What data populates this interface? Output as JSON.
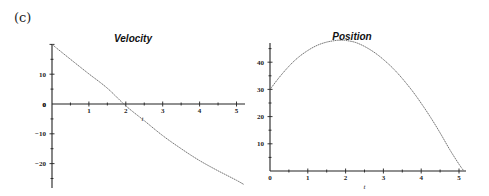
{
  "panel_label": "(c)",
  "chart_data": [
    {
      "type": "line",
      "title": "Velocity",
      "xlabel": "t",
      "ylabel": "",
      "xlim": [
        0,
        5.2
      ],
      "ylim": [
        -27,
        20
      ],
      "xticks": [
        1,
        2,
        3,
        4,
        5
      ],
      "yticks": [
        -20,
        -10,
        0,
        10
      ],
      "grid": false,
      "legend": null,
      "series": [
        {
          "name": "velocity",
          "x": [
            0,
            0.5,
            1.0,
            1.5,
            2.0,
            2.5,
            3.0,
            3.5,
            4.0,
            4.5,
            5.0,
            5.2
          ],
          "y": [
            20,
            15.0,
            10.1,
            5.3,
            -0.6,
            -5.6,
            -10.6,
            -15.0,
            -19.0,
            -22.4,
            -25.6,
            -27.0
          ]
        }
      ],
      "frame": {
        "ox": 52,
        "x_per_unit": 36.9,
        "oy": 104,
        "y_per_unit": 2.98,
        "axis_top": 44,
        "axis_bottom": 188,
        "axis_right": 245
      },
      "title_pos": {
        "x": 133,
        "y": 42
      }
    },
    {
      "type": "line",
      "title": "Position",
      "xlabel": "t",
      "ylabel": "",
      "xlim": [
        0,
        5.12
      ],
      "ylim": [
        0,
        48
      ],
      "xticks": [
        0,
        1,
        2,
        3,
        4,
        5
      ],
      "yticks": [
        10,
        20,
        30,
        40
      ],
      "grid": false,
      "legend": null,
      "series": [
        {
          "name": "position",
          "x": [
            0,
            0.25,
            0.5,
            0.75,
            1.0,
            1.25,
            1.5,
            1.75,
            1.9,
            2.0,
            2.25,
            2.5,
            2.75,
            3.0,
            3.25,
            3.5,
            3.75,
            4.0,
            4.25,
            4.5,
            4.75,
            5.0,
            5.12
          ],
          "y": [
            30,
            34.5,
            38.5,
            41.8,
            44.3,
            46.2,
            47.4,
            48.0,
            48.1,
            48.0,
            47.3,
            45.8,
            43.7,
            41.0,
            37.8,
            34.0,
            29.7,
            24.9,
            19.7,
            14.0,
            8.0,
            2.5,
            0.2
          ]
        }
      ],
      "frame": {
        "ox": 270,
        "x_per_unit": 37.8,
        "oy": 171,
        "y_per_unit": 2.72,
        "axis_top": 43,
        "axis_bottom": 171,
        "axis_right": 466
      },
      "title_pos": {
        "x": 352,
        "y": 40
      }
    }
  ]
}
